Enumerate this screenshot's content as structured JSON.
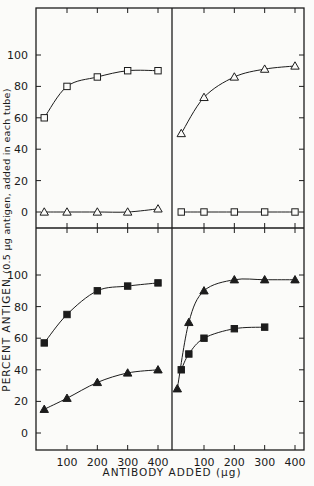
{
  "chart_data": {
    "type": "line",
    "layout": "2x2 panel grid, shared axes",
    "xlabel": "ANTIBODY ADDED (μg)",
    "ylabel": "PERCENT ANTIGEN (0.5 μg antigen, added in each tube)",
    "ylabel_main": "PERCENT ANTIGEN",
    "ylabel_sub": "(0.5 μg antigen, added in each tube)",
    "x_ticks": [
      100,
      200,
      300,
      400
    ],
    "y_ticks": [
      0,
      20,
      40,
      60,
      80,
      100
    ],
    "xlim": [
      0,
      420
    ],
    "ylim": [
      -10,
      120
    ],
    "grid": false,
    "panels": [
      {
        "position": "top-left",
        "series": [
          {
            "name": "open squares",
            "marker": "open-square",
            "x": [
              25,
              100,
              200,
              300,
              400
            ],
            "y": [
              60,
              80,
              86,
              90,
              90
            ]
          },
          {
            "name": "open triangles",
            "marker": "open-triangle",
            "x": [
              25,
              100,
              200,
              300,
              400
            ],
            "y": [
              0,
              0,
              0,
              0,
              2
            ]
          }
        ]
      },
      {
        "position": "top-right",
        "series": [
          {
            "name": "open triangles",
            "marker": "open-triangle",
            "x": [
              25,
              100,
              200,
              300,
              400
            ],
            "y": [
              50,
              73,
              86,
              91,
              93
            ]
          },
          {
            "name": "open squares",
            "marker": "open-square",
            "x": [
              25,
              100,
              200,
              300,
              400
            ],
            "y": [
              0,
              0,
              0,
              0,
              0
            ]
          }
        ]
      },
      {
        "position": "bottom-left",
        "series": [
          {
            "name": "filled squares",
            "marker": "filled-square",
            "x": [
              25,
              100,
              200,
              300,
              400
            ],
            "y": [
              57,
              75,
              90,
              93,
              95
            ]
          },
          {
            "name": "filled triangles",
            "marker": "filled-triangle",
            "x": [
              25,
              100,
              200,
              300,
              400
            ],
            "y": [
              15,
              22,
              32,
              38,
              40
            ]
          }
        ]
      },
      {
        "position": "bottom-right",
        "series": [
          {
            "name": "filled triangles",
            "marker": "filled-triangle",
            "x": [
              12,
              50,
              100,
              200,
              300,
              400
            ],
            "y": [
              28,
              70,
              90,
              97,
              97,
              97
            ]
          },
          {
            "name": "filled squares",
            "marker": "filled-square",
            "x": [
              25,
              50,
              100,
              200,
              300
            ],
            "y": [
              40,
              50,
              60,
              66,
              67
            ]
          }
        ]
      }
    ]
  }
}
